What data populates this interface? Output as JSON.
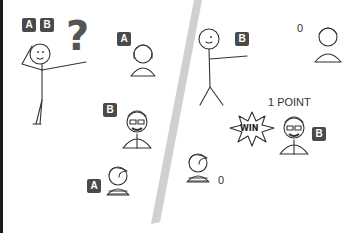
{
  "scene": {
    "left_panel": {
      "top_badges": [
        "A",
        "B"
      ],
      "question_mark": "?",
      "person_a_badge": "A",
      "person_b_badge": "B",
      "person_c_badge": "A"
    },
    "right_panel": {
      "pointer_badge": "B",
      "score_top": "0",
      "point_label": "1 POINT",
      "win_text": "WIN",
      "winner_badge": "B",
      "score_bottom": "0"
    },
    "colors": {
      "badge_bg": "#4a4a4a",
      "question_mark": "#555555",
      "divider": "#c8c8c8",
      "line": "#333333"
    }
  }
}
